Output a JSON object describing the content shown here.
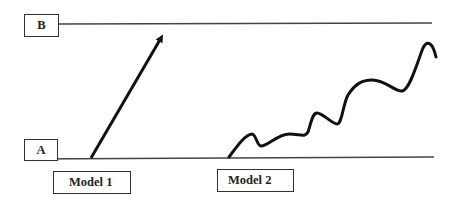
{
  "levels": {
    "top": {
      "label": "B"
    },
    "bottom": {
      "label": "A"
    }
  },
  "models": [
    {
      "label": "Model 1",
      "shape": "straight-arrow"
    },
    {
      "label": "Model 2",
      "shape": "wavy-curve"
    }
  ],
  "colors": {
    "stroke": "#111111",
    "line": "#444444",
    "background": "#ffffff"
  }
}
